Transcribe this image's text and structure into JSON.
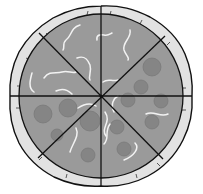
{
  "illustration": {
    "subject": "pizza",
    "slice_count": 8,
    "colors": {
      "background": "#ffffff",
      "crust": "#e2e2e2",
      "sauce": "#9a9a9a",
      "pepperoni": "#858585",
      "pepperoni_edge": "#7a7a7a",
      "cheese_strand": "#f2f2f2",
      "outline": "#111111"
    },
    "geometry": {
      "center": [
        101,
        96
      ],
      "sauce_radius": 82,
      "crust_radius": 91
    },
    "pepperoni": [
      {
        "x": 152,
        "y": 67,
        "r": 9
      },
      {
        "x": 141,
        "y": 87,
        "r": 7
      },
      {
        "x": 128,
        "y": 100,
        "r": 7
      },
      {
        "x": 161,
        "y": 101,
        "r": 7
      },
      {
        "x": 152,
        "y": 122,
        "r": 7
      },
      {
        "x": 117,
        "y": 127,
        "r": 7
      },
      {
        "x": 124,
        "y": 149,
        "r": 7
      },
      {
        "x": 88,
        "y": 155,
        "r": 7
      },
      {
        "x": 90,
        "y": 121,
        "r": 10
      },
      {
        "x": 43,
        "y": 114,
        "r": 9
      },
      {
        "x": 68,
        "y": 108,
        "r": 9
      },
      {
        "x": 57,
        "y": 135,
        "r": 6
      }
    ]
  }
}
